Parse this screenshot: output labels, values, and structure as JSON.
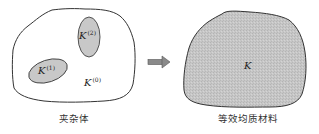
{
  "figure": {
    "left_panel": {
      "caption": "夹杂体",
      "matrix_label": {
        "base": "K",
        "superscript": "(0)"
      },
      "inclusions": [
        {
          "base": "K",
          "superscript": "(1)"
        },
        {
          "base": "K",
          "superscript": "(2)"
        }
      ]
    },
    "arrow": {
      "direction": "right",
      "color": "#777777"
    },
    "right_panel": {
      "caption": "等效均质材料",
      "label": {
        "base": "K"
      }
    },
    "colors": {
      "outline": "#333333",
      "inclusion_fill": "#c8c8c8",
      "homogeneous_fill": "#c4c4c4",
      "background": "#ffffff"
    }
  }
}
